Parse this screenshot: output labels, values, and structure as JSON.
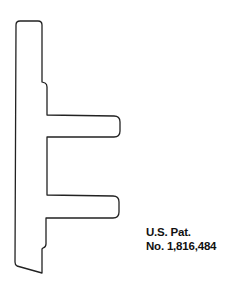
{
  "figure": {
    "stroke_color": "#222222",
    "background": "#ffffff"
  },
  "caption": {
    "line1": "U.S. Pat.",
    "line2": "No. 1,816,484"
  },
  "cutoff_text": {
    "visible": "partially cropped characters at bottom edge"
  }
}
